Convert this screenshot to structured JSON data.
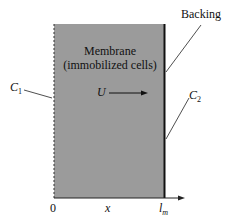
{
  "diagram": {
    "membrane_label_line1": "Membrane",
    "membrane_label_line2": "(immobilized cells)",
    "backing_label": "Backing",
    "c1_label": "C",
    "c1_sub": "1",
    "c2_label": "C",
    "c2_sub": "2",
    "velocity_label": "U",
    "axis_origin": "0",
    "axis_variable": "x",
    "axis_end": "l",
    "axis_end_sub": "m",
    "colors": {
      "membrane_fill": "#9b9b9b",
      "backing": "#111111",
      "lines": "#222222"
    }
  }
}
